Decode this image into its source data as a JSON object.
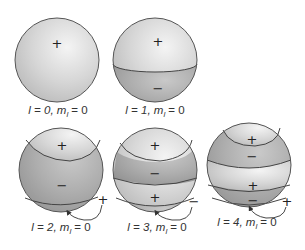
{
  "figure": {
    "colors": {
      "light_lobe": "#d8d8d8",
      "dark_lobe": "#a9a9a9",
      "outline": "#555555",
      "background": "#ffffff"
    },
    "spheres": [
      {
        "id": "l0",
        "l": "0",
        "ml": "0",
        "label_prefix": "l = 0, ",
        "label_m": "m",
        "label_sub": "l",
        "label_suffix": " = 0",
        "signs": [
          "+"
        ]
      },
      {
        "id": "l1",
        "l": "1",
        "ml": "0",
        "label_prefix": "l = 1, ",
        "label_m": "m",
        "label_sub": "l",
        "label_suffix": " = 0",
        "signs": [
          "+",
          "−"
        ]
      },
      {
        "id": "l2",
        "l": "2",
        "ml": "0",
        "label_prefix": "l = 2, ",
        "label_m": "m",
        "label_sub": "l",
        "label_suffix": " = 0",
        "signs": [
          "+",
          "−"
        ],
        "callout_sign": "+"
      },
      {
        "id": "l3",
        "l": "3",
        "ml": "0",
        "label_prefix": "l = 3, ",
        "label_m": "m",
        "label_sub": "l",
        "label_suffix": " = 0",
        "signs": [
          "+",
          "−",
          "+"
        ],
        "callout_sign": "−"
      },
      {
        "id": "l4",
        "l": "4",
        "ml": "0",
        "label_prefix": "l = 4, ",
        "label_m": "m",
        "label_sub": "l",
        "label_suffix": " = 0",
        "signs": [
          "+",
          "−",
          "+",
          "−"
        ],
        "callout_sign": "+"
      }
    ]
  }
}
